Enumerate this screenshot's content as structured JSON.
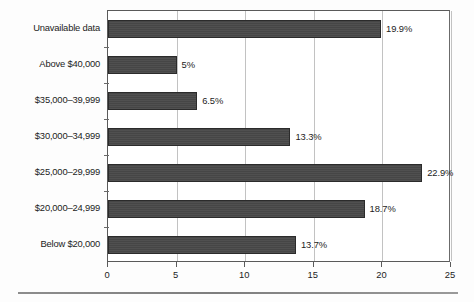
{
  "chart_data": {
    "type": "bar",
    "orientation": "horizontal",
    "title": "",
    "xlabel": "",
    "ylabel": "",
    "xlim": [
      0,
      25
    ],
    "xticks": [
      "0",
      "5",
      "10",
      "15",
      "20",
      "25"
    ],
    "xtick_values": [
      0,
      5,
      10,
      15,
      20,
      25
    ],
    "grid": "vertical",
    "legend": "none",
    "categories": [
      "Unavailable data",
      "Above $40,000",
      "$35,000–39,999",
      "$30,000–34,999",
      "$25,000–29,999",
      "$20,000–24,999",
      "Below $20,000"
    ],
    "values": [
      19.9,
      5,
      6.5,
      13.3,
      22.9,
      18.7,
      13.7
    ],
    "data_labels": [
      "19.9%",
      "5%",
      "6.5%",
      "13.3%",
      "22.9%",
      "18.7%",
      "13.7%"
    ],
    "bars": [
      {
        "category": "Unavailable data",
        "value": 19.9,
        "label": "19.9%"
      },
      {
        "category": "Above $40,000",
        "value": 5,
        "label": "5%"
      },
      {
        "category": "$35,000–39,999",
        "value": 6.5,
        "label": "6.5%"
      },
      {
        "category": "$30,000–34,999",
        "value": 13.3,
        "label": "13.3%"
      },
      {
        "category": "$25,000–29,999",
        "value": 22.9,
        "label": "22.9%"
      },
      {
        "category": "$20,000–24,999",
        "value": 18.7,
        "label": "18.7%"
      },
      {
        "category": "Below $20,000",
        "value": 13.7,
        "label": "13.7%"
      }
    ],
    "colors": {
      "bar_fill": "#4a4a4a",
      "bar_border": "#2b2b2b",
      "gridline": "#c2c2c2",
      "axis": "#5a5a5a",
      "text": "#1c1c1c",
      "background": "#fdfdfd",
      "footer_rule": "#8d8d8d"
    }
  }
}
